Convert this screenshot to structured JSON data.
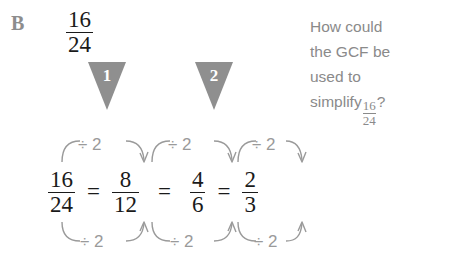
{
  "part": {
    "label": "B"
  },
  "problem": {
    "start_fraction": {
      "numerator": "16",
      "denominator": "24"
    }
  },
  "step_markers": [
    {
      "name": "step-marker-1",
      "label": "1"
    },
    {
      "name": "step-marker-2",
      "label": "2"
    }
  ],
  "question": {
    "lines": [
      "How could",
      "the GCF be",
      "used to"
    ],
    "last_line_prefix": "simplify",
    "last_line_fraction": {
      "numerator": "16",
      "denominator": "24"
    },
    "last_line_suffix": "?"
  },
  "equation": {
    "terms": [
      {
        "numerator": "16",
        "denominator": "24"
      },
      {
        "numerator": "8",
        "denominator": "12"
      },
      {
        "numerator": "4",
        "denominator": "6"
      },
      {
        "numerator": "2",
        "denominator": "3"
      }
    ],
    "operator": "="
  },
  "arrows": {
    "top_labels": [
      "÷ 2",
      "÷ 2",
      "÷ 2"
    ],
    "bottom_labels": [
      "÷ 2",
      "÷ 2",
      "÷ 2"
    ],
    "description_top": "divide numerator by 2",
    "description_bottom": "divide denominator by 2"
  },
  "colors": {
    "text": "#1a1a1a",
    "gray_text": "#8a8a8a",
    "marker_fill": "#8f8f8f",
    "arrow": "#9a9a9a",
    "background": "#ffffff"
  }
}
